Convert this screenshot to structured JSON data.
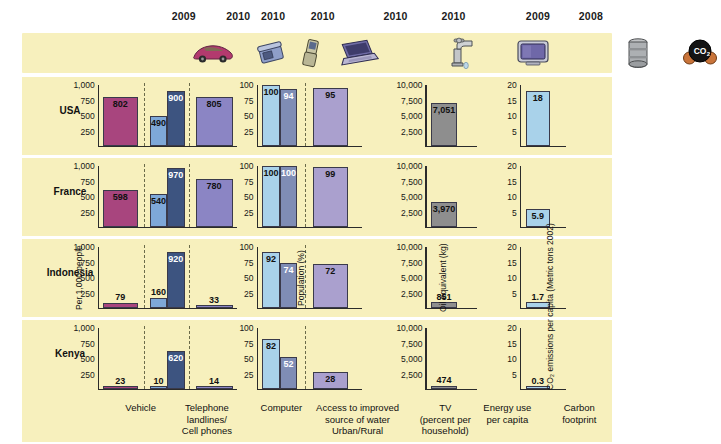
{
  "chart_data": {
    "type": "bar",
    "title": "",
    "countries": [
      "USA",
      "France",
      "Indonesia",
      "Kenya"
    ],
    "years": [
      {
        "label": "2009",
        "x": 222
      },
      {
        "label": "2010",
        "x": 288
      },
      {
        "label": "2010",
        "x": 330
      },
      {
        "label": "2010",
        "x": 390
      },
      {
        "label": "2010",
        "x": 478
      },
      {
        "label": "2010",
        "x": 548
      },
      {
        "label": "2009",
        "x": 650
      },
      {
        "label": "2008",
        "x": 714
      }
    ],
    "icons": [
      {
        "name": "car-icon",
        "x": 185
      },
      {
        "name": "telephone-landline-icon",
        "x": 243
      },
      {
        "name": "cell-phone-icon",
        "x": 283
      },
      {
        "name": "laptop-computer-icon",
        "x": 330
      },
      {
        "name": "water-faucet-icon",
        "x": 435
      },
      {
        "name": "television-icon",
        "x": 505
      },
      {
        "name": "oil-barrel-icon",
        "x": 610
      },
      {
        "name": "co2-molecule-icon",
        "x": 672
      }
    ],
    "panels": [
      {
        "id": "transport-communication",
        "ylabel": "Per 1,000 people",
        "ylim": [
          0,
          1000
        ],
        "ticks": [
          "1,000",
          "750",
          "500",
          "250"
        ],
        "series": [
          "Vehicle",
          "Telephone landlines",
          "Cell phones",
          "Computer"
        ],
        "categories": [
          "Vehicle",
          "Telephone landlines/ Cell phones",
          "Computer"
        ]
      },
      {
        "id": "water-tv",
        "ylabel": "Population (%)",
        "ylim": [
          0,
          100
        ],
        "ticks": [
          "100",
          "75",
          "50",
          "25"
        ],
        "series": [
          "Urban water",
          "Rural water",
          "TV"
        ],
        "categories": [
          "Access to improved source of water Urban/Rural",
          "TV (percent per household)"
        ]
      },
      {
        "id": "energy",
        "ylabel": "Oil equivalent (kg)",
        "ylim": [
          0,
          10000
        ],
        "ticks": [
          "10,000",
          "7,500",
          "5,000",
          "2,500"
        ],
        "series": [
          "Energy use per capita"
        ],
        "categories": [
          "Energy use per capita"
        ]
      },
      {
        "id": "carbon",
        "ylabel": "CO₂ emissions per capita (Metric tons 2002)",
        "ylim": [
          0,
          20
        ],
        "ticks": [
          "20",
          "15",
          "10",
          "5"
        ],
        "series": [
          "Carbon footprint"
        ],
        "categories": [
          "Carbon footprint"
        ]
      }
    ],
    "values": {
      "USA": {
        "vehicle": 802,
        "landline": 490,
        "cell": 900,
        "computer": 805,
        "water_urban": 100,
        "water_rural": 94,
        "tv": 95,
        "energy": 7051,
        "carbon": 18
      },
      "France": {
        "vehicle": 598,
        "landline": 540,
        "cell": 970,
        "computer": 780,
        "water_urban": 100,
        "water_rural": 100,
        "tv": 99,
        "energy": 3970,
        "carbon": 5.9
      },
      "Indonesia": {
        "vehicle": 79,
        "landline": 160,
        "cell": 920,
        "computer": 33,
        "water_urban": 92,
        "water_rural": 74,
        "tv": 72,
        "energy": 851,
        "carbon": 1.7
      },
      "Kenya": {
        "vehicle": 23,
        "landline": 10,
        "cell": 620,
        "computer": 14,
        "water_urban": 82,
        "water_rural": 52,
        "tv": 28,
        "energy": 474,
        "carbon": 0.3
      }
    },
    "labels": {
      "USA": {
        "vehicle": "802",
        "landline": "490",
        "cell": "900",
        "computer": "805",
        "water_urban": "100",
        "water_rural": "94",
        "tv": "95",
        "energy": "7,051",
        "carbon": "18"
      },
      "France": {
        "vehicle": "598",
        "landline": "540",
        "cell": "970",
        "computer": "780",
        "water_urban": "100",
        "water_rural": "100",
        "tv": "99",
        "energy": "3,970",
        "carbon": "5.9"
      },
      "Indonesia": {
        "vehicle": "79",
        "landline": "160",
        "cell": "920",
        "computer": "33",
        "water_urban": "92",
        "water_rural": "74",
        "tv": "72",
        "energy": "851",
        "carbon": "1.7"
      },
      "Kenya": {
        "vehicle": "23",
        "landline": "10",
        "cell": "620",
        "computer": "14",
        "water_urban": "82",
        "water_rural": "52",
        "tv": "28",
        "energy": "474",
        "carbon": "0.3"
      }
    },
    "footer_labels": [
      {
        "text": "Vehicle",
        "x": 130,
        "w": 80
      },
      {
        "text": "Telephone\nlandlines/\nCell phones",
        "x": 205,
        "w": 90
      },
      {
        "text": "Computer",
        "x": 300,
        "w": 80
      },
      {
        "text": "Access to improved\nsource of water\nUrban/Rural",
        "x": 372,
        "w": 120
      },
      {
        "text": "TV\n(percent per\nhousehold)",
        "x": 495,
        "w": 86
      },
      {
        "text": "Energy use\nper capita",
        "x": 570,
        "w": 86
      },
      {
        "text": "Carbon\nfootprint",
        "x": 660,
        "w": 80
      }
    ],
    "colors": {
      "background": "#f7f0bd",
      "vehicle": "#a8457e",
      "landline": "#7ea8d8",
      "cell": "#3d5480",
      "computer": "#8b85c4",
      "water_urban": "#a9d2ea",
      "water_rural": "#7f8db5",
      "tv": "#aaa0ce",
      "energy": "#8e8e8e",
      "carbon": "#a9d2ea"
    }
  }
}
